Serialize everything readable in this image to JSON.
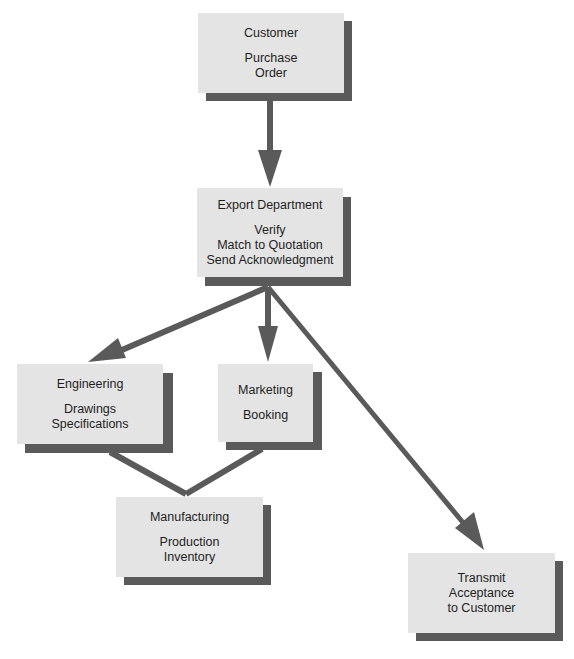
{
  "diagram": {
    "type": "flowchart",
    "colors": {
      "box_fill": "#e4e4e4",
      "shadow": "#5a5a5a",
      "arrow": "#5a5a5a",
      "text": "#1e1e1e",
      "background": "#ffffff"
    },
    "nodes": {
      "customer": {
        "title": "Customer",
        "lines": [
          "Purchase",
          "Order"
        ]
      },
      "export": {
        "title": "Export Department",
        "lines": [
          "Verify",
          "Match to Quotation",
          "Send Acknowledgment"
        ]
      },
      "engineering": {
        "title": "Engineering",
        "lines": [
          "Drawings",
          "Specifications"
        ]
      },
      "marketing": {
        "title": "Marketing",
        "lines": [
          "Booking"
        ]
      },
      "manufacturing": {
        "title": "Manufacturing",
        "lines": [
          "Production",
          "Inventory"
        ]
      },
      "transmit": {
        "title": "",
        "lines": [
          "Transmit",
          "Acceptance",
          "to Customer"
        ]
      }
    },
    "edges": [
      {
        "from": "customer",
        "to": "export",
        "type": "arrow"
      },
      {
        "from": "export",
        "to": "engineering",
        "type": "arrow"
      },
      {
        "from": "export",
        "to": "marketing",
        "type": "arrow"
      },
      {
        "from": "export",
        "to": "transmit",
        "type": "arrow"
      },
      {
        "from": "engineering",
        "to": "manufacturing",
        "type": "line"
      },
      {
        "from": "marketing",
        "to": "manufacturing",
        "type": "line"
      }
    ]
  }
}
